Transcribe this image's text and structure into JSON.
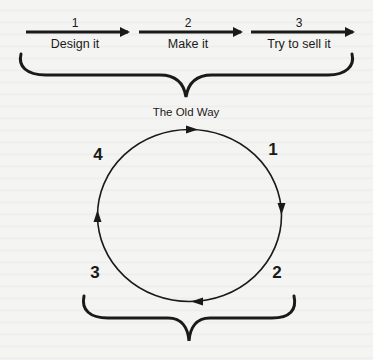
{
  "old_way": {
    "steps": [
      {
        "number": "1",
        "label": "Design it"
      },
      {
        "number": "2",
        "label": "Make it"
      },
      {
        "number": "3",
        "label": "Try to sell it"
      }
    ],
    "caption": "The Old Way"
  },
  "cycle": {
    "numbers": [
      "1",
      "2",
      "3",
      "4"
    ],
    "direction": "clockwise"
  },
  "colors": {
    "ink": "#1a1a1a",
    "background": "#f4f4f2"
  }
}
